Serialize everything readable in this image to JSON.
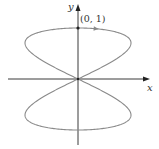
{
  "chart_data": {
    "type": "line",
    "title": "",
    "xlabel": "x",
    "ylabel": "y",
    "annotations": [
      {
        "text": "(0, 1)",
        "x": 0,
        "y": 1
      }
    ],
    "series": [
      {
        "name": "curve",
        "param": "t",
        "x_expr": "sin(2t)",
        "y_expr": "cos(t)",
        "t_range": [
          0,
          6.2832
        ]
      }
    ],
    "xlim": [
      -1.35,
      1.35
    ],
    "ylim": [
      -1.3,
      1.5
    ],
    "grid": false,
    "direction_arrow": {
      "at_t": 0.18,
      "direction": "right"
    }
  },
  "axes": {
    "x_label": "x",
    "y_label": "y"
  },
  "point": {
    "label": "(0, 1)"
  },
  "colors": {
    "axis": "#3a3a3a",
    "curve": "#8a8a8a"
  }
}
